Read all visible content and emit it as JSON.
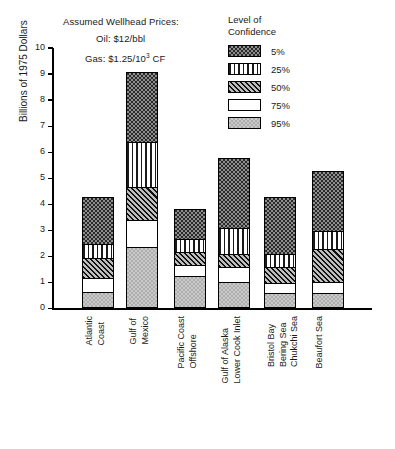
{
  "note": {
    "title": "Assumed Wellhead Prices:",
    "oil": "Oil:  $12/bbl",
    "gas_prefix": "Gas:  $1.25/10",
    "gas_exp": "3",
    "gas_suffix": " CF"
  },
  "legend": {
    "title_line1": "Level of",
    "title_line2": "Confidence",
    "items": [
      {
        "label": "5%",
        "pattern": "dotted-dark"
      },
      {
        "label": "25%",
        "pattern": "vertical-stripes"
      },
      {
        "label": "50%",
        "pattern": "diagonal-hatch"
      },
      {
        "label": "75%",
        "pattern": "blank-white"
      },
      {
        "label": "95%",
        "pattern": "light-gray"
      }
    ]
  },
  "chart_data": {
    "type": "bar",
    "subtype": "stacked",
    "title": "",
    "xlabel": "",
    "ylabel": "Billions of 1975 Dollars",
    "ylim": [
      0,
      10
    ],
    "yticks": [
      0,
      1,
      2,
      3,
      4,
      5,
      6,
      7,
      8,
      9,
      10
    ],
    "grid": false,
    "legend_position": "top-right",
    "categories": [
      "Atlantic Coast",
      "Gulf of Mexico",
      "Pacific Coast Offshore",
      "Gulf of Alaska Lower Cook Inlet",
      "Bristol Bay Bering Sea Chukchi Sea",
      "Beaufort Sea"
    ],
    "category_lines": [
      [
        "Atlantic",
        "Coast"
      ],
      [
        "Gulf of",
        "Mexico"
      ],
      [
        "Pacific Coast",
        "Offshore"
      ],
      [
        "Gulf of Alaska",
        "Lower Cook Inlet"
      ],
      [
        "Bristol Bay",
        "Bering Sea",
        "Chukchi Sea"
      ],
      [
        "Beaufort Sea"
      ]
    ],
    "series": [
      {
        "name": "95%",
        "pattern": "light-gray",
        "values": [
          0.55,
          2.3,
          1.15,
          0.95,
          0.5,
          0.5
        ]
      },
      {
        "name": "75%",
        "pattern": "blank-white",
        "values": [
          0.55,
          1.0,
          0.45,
          0.55,
          0.4,
          0.45
        ]
      },
      {
        "name": "50%",
        "pattern": "diagonal-hatch",
        "values": [
          0.75,
          1.3,
          0.5,
          0.5,
          0.6,
          1.25
        ]
      },
      {
        "name": "25%",
        "pattern": "vertical-stripes",
        "values": [
          0.55,
          1.7,
          0.5,
          1.0,
          0.5,
          0.7
        ]
      },
      {
        "name": "5%",
        "pattern": "dotted-dark",
        "values": [
          1.8,
          2.7,
          1.15,
          2.7,
          2.2,
          2.3
        ]
      }
    ],
    "totals": [
      4.2,
      9.0,
      3.75,
      5.7,
      4.2,
      5.2
    ]
  }
}
